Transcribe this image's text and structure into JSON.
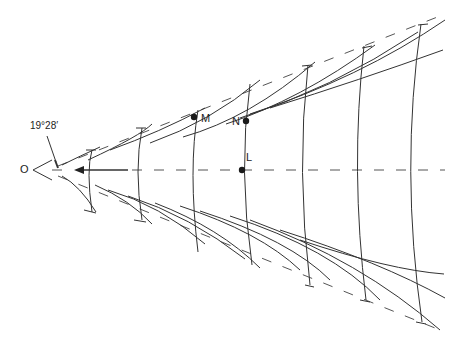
{
  "labels": {
    "origin": "O",
    "angle": "19°28′",
    "point_m": "M",
    "point_n": "N",
    "point_l": "L"
  },
  "figure": {
    "arrow_direction": "left",
    "points": [
      {
        "name": "M",
        "x": 194,
        "y": 117
      },
      {
        "name": "N",
        "x": 246,
        "y": 121
      },
      {
        "name": "L",
        "x": 242,
        "y": 170
      }
    ],
    "vertical_arc_x": [
      88,
      136,
      190,
      242,
      300,
      355,
      408
    ],
    "colors": {
      "line": "#333333",
      "point": "#1a1a1a",
      "background": "#ffffff"
    }
  }
}
